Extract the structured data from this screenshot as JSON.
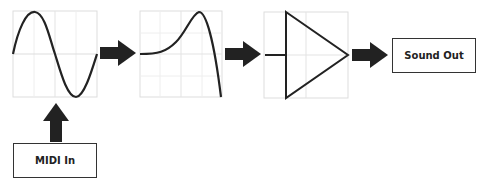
{
  "diagram": {
    "title": "",
    "nodes": [
      {
        "id": "oscillator",
        "type": "graph-panel",
        "content": "sine-wave"
      },
      {
        "id": "waveshaper",
        "type": "graph-panel",
        "content": "transfer-curve"
      },
      {
        "id": "amplifier",
        "type": "graph-panel",
        "content": "amplifier-triangle"
      },
      {
        "id": "sound_out",
        "type": "box",
        "label": "Sound Out"
      },
      {
        "id": "midi_in",
        "type": "box",
        "label": "MIDI In"
      }
    ],
    "edges": [
      {
        "from": "midi_in",
        "to": "oscillator",
        "style": "thick-arrow"
      },
      {
        "from": "oscillator",
        "to": "waveshaper",
        "style": "thick-arrow"
      },
      {
        "from": "waveshaper",
        "to": "amplifier",
        "style": "thick-arrow"
      },
      {
        "from": "amplifier",
        "to": "sound_out",
        "style": "thick-arrow"
      }
    ]
  },
  "labels": {
    "sound_out": "Sound Out",
    "midi_in": "MIDI In"
  },
  "colors": {
    "stroke": "#222222",
    "grid": "#dddddd",
    "arrow": "#222222"
  }
}
